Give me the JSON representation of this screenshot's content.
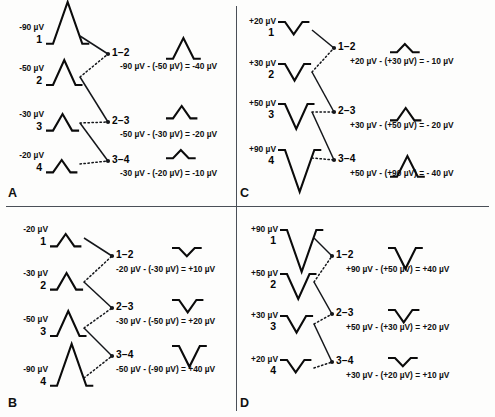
{
  "figure": {
    "panels": [
      "A",
      "B",
      "C",
      "D"
    ],
    "units": "µV"
  },
  "panel_letters": {
    "a": "A",
    "b": "B",
    "c": "C",
    "d": "D"
  },
  "chart_data": {
    "type": "diagram",
    "ylabel": "",
    "xlabel": "",
    "panels": [
      {
        "id": "A",
        "polarity": "negative",
        "trend": "descending",
        "channels": [
          {
            "num": "1",
            "amp": "-90 µV",
            "value": -90,
            "shape": "peak-up"
          },
          {
            "num": "2",
            "amp": "-50 µV",
            "value": -50,
            "shape": "peak-up"
          },
          {
            "num": "3",
            "amp": "-30 µV",
            "value": -30,
            "shape": "peak-up"
          },
          {
            "num": "4",
            "amp": "-20 µV",
            "value": -20,
            "shape": "peak-up"
          }
        ],
        "derivations": [
          {
            "label": "1–2",
            "eq": "-90 µV - (-50 µV) = -40 µV",
            "value": -40,
            "shape": "peak-up"
          },
          {
            "label": "2–3",
            "eq": "-50 µV - (-30 µV) = -20 µV",
            "value": -20,
            "shape": "peak-up"
          },
          {
            "label": "3–4",
            "eq": "-30 µV - (-20 µV) = -10 µV",
            "value": -10,
            "shape": "peak-up"
          }
        ]
      },
      {
        "id": "B",
        "polarity": "negative",
        "trend": "ascending",
        "channels": [
          {
            "num": "1",
            "amp": "-20 µV",
            "value": -20,
            "shape": "peak-up"
          },
          {
            "num": "2",
            "amp": "-30 µV",
            "value": -30,
            "shape": "peak-up"
          },
          {
            "num": "3",
            "amp": "-50 µV",
            "value": -50,
            "shape": "peak-up"
          },
          {
            "num": "4",
            "amp": "-90 µV",
            "value": -90,
            "shape": "peak-up"
          }
        ],
        "derivations": [
          {
            "label": "1–2",
            "eq": "-20 µV - (-30 µV) = +10 µV",
            "value": 10,
            "shape": "peak-down"
          },
          {
            "label": "2–3",
            "eq": "-30 µV - (-50 µV) = +20 µV",
            "value": 20,
            "shape": "peak-down"
          },
          {
            "label": "3–4",
            "eq": "-50 µV - (-90 µV) = +40 µV",
            "value": 40,
            "shape": "peak-down"
          }
        ]
      },
      {
        "id": "C",
        "polarity": "positive",
        "trend": "ascending",
        "channels": [
          {
            "num": "1",
            "amp": "+20 µV",
            "value": 20,
            "shape": "peak-down"
          },
          {
            "num": "2",
            "amp": "+30 µV",
            "value": 30,
            "shape": "peak-down"
          },
          {
            "num": "3",
            "amp": "+50 µV",
            "value": 50,
            "shape": "peak-down"
          },
          {
            "num": "4",
            "amp": "+90 µV",
            "value": 90,
            "shape": "peak-down"
          }
        ],
        "derivations": [
          {
            "label": "1–2",
            "eq": "+20 µV - (+30 µV) = - 10 µV",
            "value": -10,
            "shape": "peak-up"
          },
          {
            "label": "2–3",
            "eq": "+30 µV - (+50 µV) = - 20 µV",
            "value": -20,
            "shape": "peak-up"
          },
          {
            "label": "3–4",
            "eq": "+50 µV - (+90 µV) = - 40 µV",
            "value": -40,
            "shape": "peak-up"
          }
        ]
      },
      {
        "id": "D",
        "polarity": "positive",
        "trend": "descending",
        "channels": [
          {
            "num": "1",
            "amp": "+90 µV",
            "value": 90,
            "shape": "peak-down"
          },
          {
            "num": "2",
            "amp": "+50 µV",
            "value": 50,
            "shape": "peak-down"
          },
          {
            "num": "3",
            "amp": "+30 µV",
            "value": 30,
            "shape": "peak-down"
          },
          {
            "num": "4",
            "amp": "+20 µV",
            "value": 20,
            "shape": "peak-down"
          }
        ],
        "derivations": [
          {
            "label": "1–2",
            "eq": "+90 µV - (+50 µV) = +40 µV",
            "value": 40,
            "shape": "peak-down"
          },
          {
            "label": "2–3",
            "eq": "+50 µV - (+30 µV) = +20 µV",
            "value": 20,
            "shape": "peak-down"
          },
          {
            "label": "3–4",
            "eq": "+30 µV - (+20 µV) = +10 µV",
            "value": 10,
            "shape": "peak-down"
          }
        ]
      }
    ]
  },
  "colors": {
    "ink": "#0b0b0b",
    "divider": "#4a4f57",
    "background": "#fdfdfc"
  }
}
